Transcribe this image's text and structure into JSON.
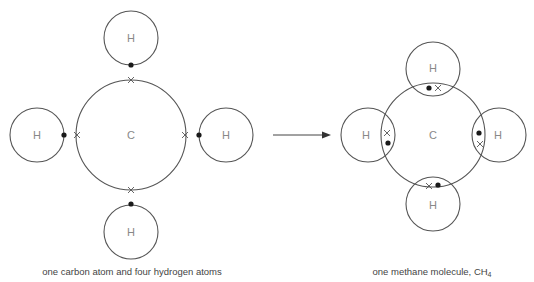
{
  "left_panel": {
    "caption": "one carbon atom and four hydrogen atoms",
    "carbon": {
      "label": "C",
      "cx": 131,
      "cy": 135,
      "r": 55
    },
    "hydrogens": [
      {
        "position": "top",
        "label": "H",
        "cx": 131,
        "cy": 38,
        "r": 27,
        "dot": [
          131,
          65
        ],
        "cross": [
          131,
          80
        ]
      },
      {
        "position": "left",
        "label": "H",
        "cx": 37,
        "cy": 135,
        "r": 27,
        "dot": [
          64,
          135
        ],
        "cross": [
          77,
          135
        ]
      },
      {
        "position": "right",
        "label": "H",
        "cx": 226,
        "cy": 135,
        "r": 27,
        "dot": [
          199,
          135
        ],
        "cross": [
          185,
          135
        ]
      },
      {
        "position": "bottom",
        "label": "H",
        "cx": 131,
        "cy": 232,
        "r": 27,
        "dot": [
          131,
          204
        ],
        "cross": [
          131,
          190
        ]
      }
    ]
  },
  "arrow": {
    "x1": 273,
    "x2": 331,
    "y": 135
  },
  "right_panel": {
    "caption_main": "one methane molecule, CH",
    "caption_subscript": "4",
    "carbon": {
      "label": "C",
      "cx": 433,
      "cy": 135,
      "r": 52
    },
    "hydrogens": [
      {
        "position": "top",
        "label": "H",
        "cx": 433,
        "cy": 69,
        "r": 27,
        "dot": [
          429,
          88
        ],
        "cross": [
          438,
          88
        ]
      },
      {
        "position": "left",
        "label": "H",
        "cx": 368,
        "cy": 135,
        "r": 27,
        "dot": [
          388,
          143
        ],
        "cross": [
          387,
          133
        ]
      },
      {
        "position": "right",
        "label": "H",
        "cx": 499,
        "cy": 135,
        "r": 27,
        "dot": [
          479,
          133
        ],
        "cross": [
          480,
          144
        ]
      },
      {
        "position": "bottom",
        "label": "H",
        "cx": 433,
        "cy": 204,
        "r": 27,
        "dot": [
          438,
          185
        ],
        "cross": [
          429,
          186
        ]
      }
    ]
  },
  "legend": {
    "dot_meaning": "hydrogen electron",
    "cross_meaning": "carbon electron"
  }
}
